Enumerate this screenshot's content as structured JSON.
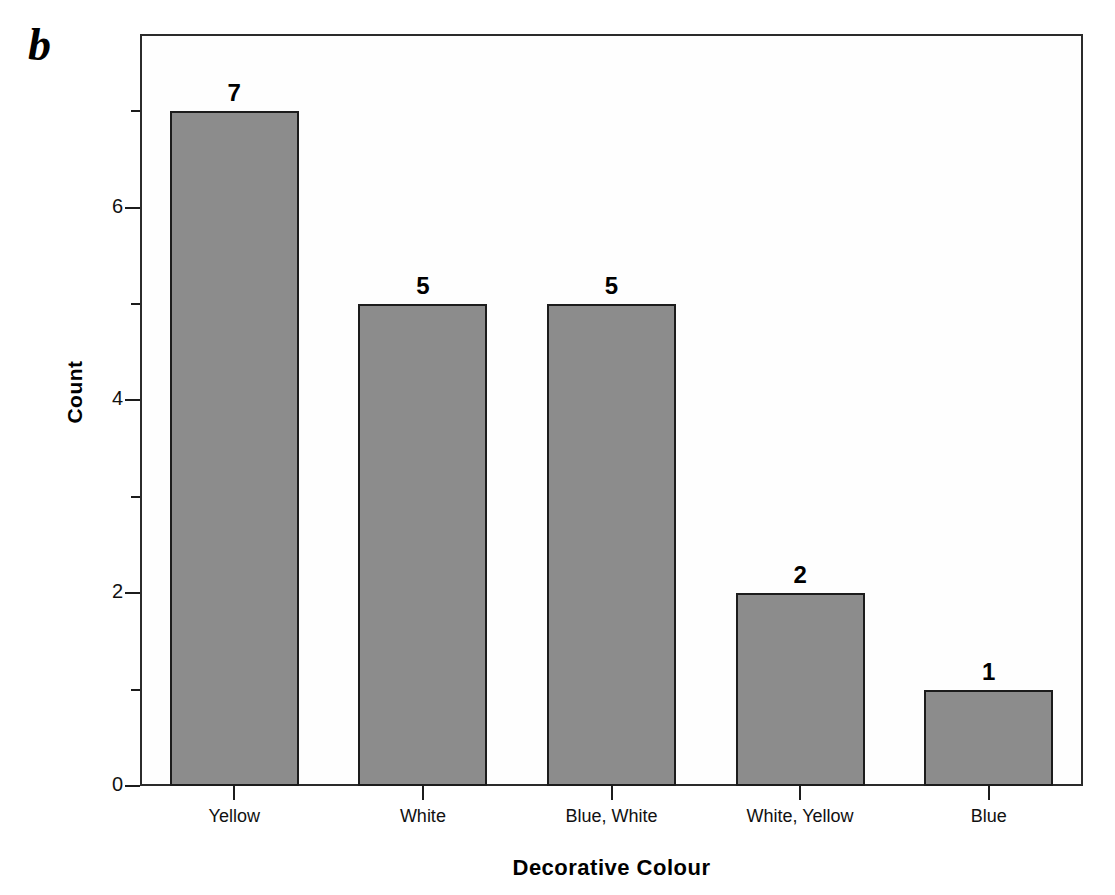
{
  "panel": {
    "letter": "b"
  },
  "chart_data": {
    "type": "bar",
    "title": "",
    "subtitle": "",
    "xlabel": "Decorative Colour",
    "ylabel": "Count",
    "categories": [
      "Yellow",
      "White",
      "Blue, White",
      "White, Yellow",
      "Blue"
    ],
    "values": [
      7,
      5,
      5,
      2,
      1
    ],
    "value_labels": [
      "7",
      "5",
      "5",
      "2",
      "1"
    ],
    "ylim": [
      0,
      7.8
    ],
    "y_major_ticks": [
      0,
      2,
      4,
      6
    ],
    "y_major_tick_labels": [
      "0",
      "2",
      "4",
      "6"
    ],
    "y_minor_ticks": [
      1,
      3,
      5,
      7
    ],
    "grid": false,
    "legend": false,
    "legend_position": "none",
    "bar_fill_color": "#8c8c8c",
    "bar_edge_color": "#1c1c1c",
    "axis_color": "#2b2b2b",
    "background_color": "#ffffff",
    "panel_label": "b"
  }
}
